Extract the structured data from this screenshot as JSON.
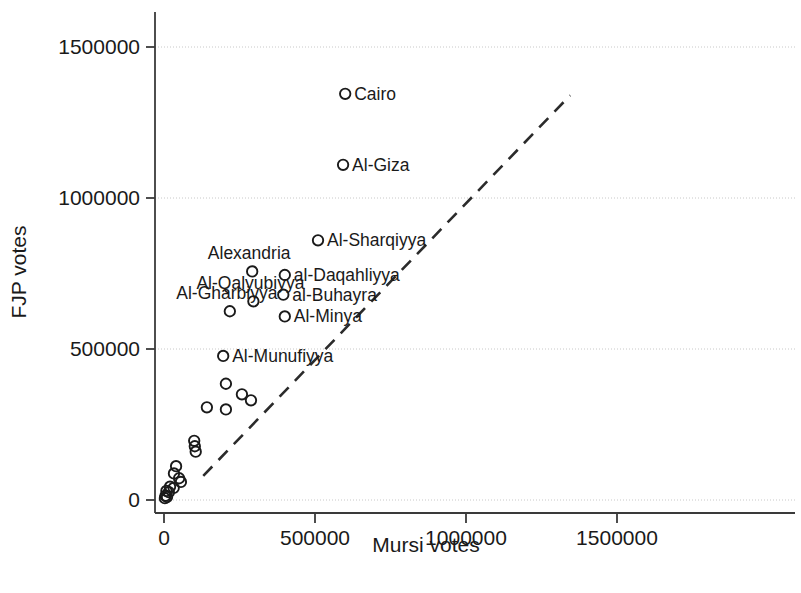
{
  "chart_data": {
    "type": "scatter",
    "title": "",
    "xlabel": "Mursi votes",
    "ylabel": "FJP votes",
    "xlim": [
      -40000,
      1670000
    ],
    "ylim": [
      -25000,
      1640000
    ],
    "xticks": [
      0,
      500000,
      1000000,
      1500000
    ],
    "yticks": [
      0,
      500000,
      1000000,
      1500000
    ],
    "xticklabels": [
      "0",
      "500000",
      "1000000",
      "1500000"
    ],
    "yticklabels": [
      "0",
      "500000",
      "1000000",
      "1500000"
    ],
    "grid": "horizontal-dotted",
    "legend": "none",
    "marker": "open-circle",
    "reference_line": {
      "kind": "dashed",
      "description": "45-degree y = x reference line",
      "x_start": 130000,
      "y_start": 80000,
      "x_end": 1345000,
      "y_end": 1340000
    },
    "points": [
      {
        "label": "Cairo",
        "x": 600000,
        "y": 1345000,
        "label_pos": "right"
      },
      {
        "label": "Al-Giza",
        "x": 593000,
        "y": 1110000,
        "label_pos": "right"
      },
      {
        "label": "Al-Sharqiyya",
        "x": 510000,
        "y": 860000,
        "label_pos": "right"
      },
      {
        "label": "al-Daqahliyya",
        "x": 400000,
        "y": 745000,
        "label_pos": "right"
      },
      {
        "label": "al-Buhayra",
        "x": 395000,
        "y": 680000,
        "label_pos": "right"
      },
      {
        "label": "Al-Minya",
        "x": 400000,
        "y": 608000,
        "label_pos": "right"
      },
      {
        "label": "Alexandria",
        "x": 292000,
        "y": 757000,
        "label_pos": "above"
      },
      {
        "label": "Al-Qalyubiyya",
        "x": 296000,
        "y": 658000,
        "label_pos": "above"
      },
      {
        "label": "Al-Gharbiyya",
        "x": 218000,
        "y": 625000,
        "label_pos": "above"
      },
      {
        "label": "Al-Munufiyya",
        "x": 196000,
        "y": 477000,
        "label_pos": "right"
      },
      {
        "label": "",
        "x": 205000,
        "y": 385000,
        "label_pos": "none"
      },
      {
        "label": "",
        "x": 258000,
        "y": 350000,
        "label_pos": "none"
      },
      {
        "label": "",
        "x": 288000,
        "y": 330000,
        "label_pos": "none"
      },
      {
        "label": "",
        "x": 142000,
        "y": 307000,
        "label_pos": "none"
      },
      {
        "label": "",
        "x": 205000,
        "y": 300000,
        "label_pos": "none"
      },
      {
        "label": "",
        "x": 100000,
        "y": 196000,
        "label_pos": "none"
      },
      {
        "label": "",
        "x": 102000,
        "y": 178000,
        "label_pos": "none"
      },
      {
        "label": "",
        "x": 105000,
        "y": 160000,
        "label_pos": "none"
      },
      {
        "label": "",
        "x": 40000,
        "y": 112000,
        "label_pos": "none"
      },
      {
        "label": "",
        "x": 33000,
        "y": 88000,
        "label_pos": "none"
      },
      {
        "label": "",
        "x": 50000,
        "y": 72000,
        "label_pos": "none"
      },
      {
        "label": "",
        "x": 56000,
        "y": 60000,
        "label_pos": "none"
      },
      {
        "label": "",
        "x": 20000,
        "y": 44000,
        "label_pos": "none"
      },
      {
        "label": "",
        "x": 32000,
        "y": 40000,
        "label_pos": "none"
      },
      {
        "label": "",
        "x": 8000,
        "y": 30000,
        "label_pos": "none"
      },
      {
        "label": "",
        "x": 16000,
        "y": 26000,
        "label_pos": "none"
      },
      {
        "label": "",
        "x": 5000,
        "y": 14000,
        "label_pos": "none"
      },
      {
        "label": "",
        "x": 10000,
        "y": 10000,
        "label_pos": "none"
      },
      {
        "label": "",
        "x": 3000,
        "y": 6000,
        "label_pos": "none"
      }
    ]
  },
  "colors": {
    "axis": "#3a3a3a",
    "grid": "#c8c8c8",
    "marker_stroke": "#1a1a1a",
    "reference_line": "#2b2b2b",
    "text": "#1a1a1a",
    "background": "#ffffff"
  }
}
